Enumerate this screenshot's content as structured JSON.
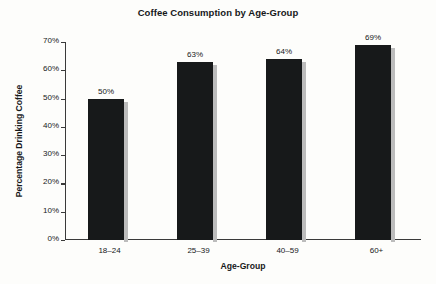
{
  "chart_data": {
    "type": "bar",
    "title": "Coffee Consumption by Age-Group",
    "xlabel": "Age-Group",
    "ylabel": "Percentage Drinking Coffee",
    "categories": [
      "18–24",
      "25–39",
      "40–59",
      "60+"
    ],
    "values": [
      50,
      63,
      64,
      69
    ],
    "value_labels": [
      "50%",
      "63%",
      "64%",
      "69%"
    ],
    "ylim": [
      0,
      70
    ],
    "ytick_values": [
      0,
      10,
      20,
      30,
      40,
      50,
      60,
      70
    ],
    "ytick_labels": [
      "0%",
      "10%",
      "20%",
      "30%",
      "40%",
      "50%",
      "60%",
      "70%"
    ],
    "grid": false,
    "legend": false,
    "bar_color": "#17191a",
    "bar_shadow_color": "#bcbcbc",
    "axis_color": "#3a3a3a",
    "text_color": "#16181a",
    "background_color": "#fdfdfb"
  }
}
